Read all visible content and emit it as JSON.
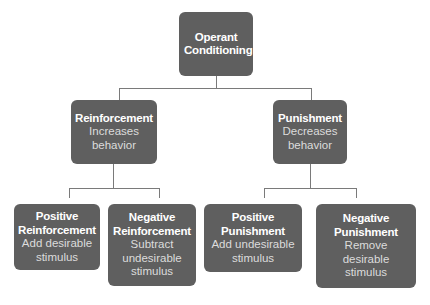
{
  "diagram": {
    "root": {
      "title": "Operant Conditioning"
    },
    "level2": [
      {
        "title": "Reinforcement",
        "desc": "Increases behavior"
      },
      {
        "title": "Punishment",
        "desc": "Decreases behavior"
      }
    ],
    "level3": [
      {
        "title": "Positive Reinforcement",
        "desc": "Add desirable stimulus"
      },
      {
        "title": "Negative Reinforcement",
        "desc": "Subtract undesirable stimulus"
      },
      {
        "title": "Positive Punishment",
        "desc": "Add undesirable stimulus"
      },
      {
        "title": "Negative Punishment",
        "desc": "Remove desirable stimulus"
      }
    ],
    "colors": {
      "box": "#5f5f5f",
      "text": "#ffffff",
      "line": "#7a7a7a"
    }
  }
}
